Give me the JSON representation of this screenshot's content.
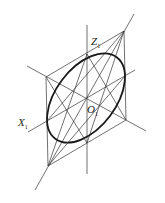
{
  "diagram": {
    "type": "isometric-ellipse-construction",
    "labels": {
      "z_axis": "Z",
      "z_sub": "1",
      "x_axis": "X",
      "x_sub": "1",
      "origin": "O",
      "origin_sub": "1"
    },
    "colors": {
      "line": "#333333",
      "ellipse": "#1a1a1a",
      "background": "#ffffff"
    }
  }
}
